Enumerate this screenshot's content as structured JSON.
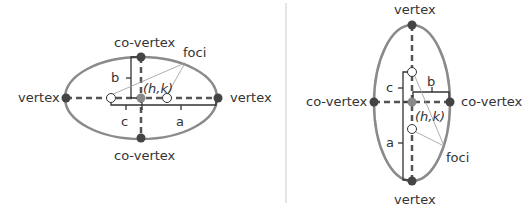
{
  "colors": {
    "ellipse": "#8a8a8a",
    "axis": "#555555",
    "vertex_point": "#444444",
    "center_point": "#888888",
    "focus_fill": "#ffffff",
    "bracket": "#333333",
    "leader": "#999999",
    "divider": "#cccccc",
    "text": "#333333"
  },
  "horizontal": {
    "vertex_left": "vertex",
    "vertex_right": "vertex",
    "covertex_top": "co-vertex",
    "covertex_bottom": "co-vertex",
    "foci": "foci",
    "center": "(h,k)",
    "b": "b",
    "c": "c",
    "a": "a"
  },
  "vertical": {
    "vertex_top": "vertex",
    "vertex_bottom": "vertex",
    "covertex_left": "co-vertex",
    "covertex_right": "co-vertex",
    "foci": "foci",
    "center": "(h,k)",
    "b": "b",
    "c": "c",
    "a": "a"
  }
}
